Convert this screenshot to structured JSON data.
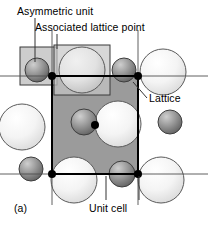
{
  "figure": {
    "panel_label": "(a)",
    "labels": {
      "asymmetric_unit": "Asymmetric unit",
      "associated_lattice_point": "Associated lattice point",
      "lattice": "Lattice",
      "unit_cell": "Unit cell"
    },
    "colors": {
      "background": "#ffffff",
      "line": "#000000",
      "unit_cell_fill": "#9a9a9a",
      "highlight_box_fill": "#c9c9c9",
      "large_atom_light": "#f2f2f2",
      "large_atom_edge": "#555555",
      "small_atom_dark": "#6e6e6e",
      "small_atom_edge": "#3a3a3a",
      "lattice_point": "#000000"
    },
    "geometry": {
      "unit_cell": {
        "x": 52,
        "y": 76,
        "width": 86,
        "height": 98
      },
      "asymmetric_unit_box": {
        "x": 20,
        "y": 47,
        "width": 37,
        "height": 38
      },
      "associated_lattice_point_box": {
        "x": 54,
        "y": 45,
        "width": 56,
        "height": 50
      },
      "lattice_rows_y": [
        76,
        174
      ],
      "lattice_cols_x": [
        52,
        138
      ],
      "large_atom_radius": 22,
      "small_atom_radius": 11
    },
    "lattice_points": [
      {
        "x": 52,
        "y": 76
      },
      {
        "x": 138,
        "y": 76
      },
      {
        "x": 52,
        "y": 174
      },
      {
        "x": 138,
        "y": 174
      },
      {
        "x": 95,
        "y": 125
      }
    ],
    "large_atoms": [
      {
        "x": 82,
        "y": 70,
        "r": 23
      },
      {
        "x": 163,
        "y": 72,
        "r": 23
      },
      {
        "x": 22,
        "y": 127,
        "r": 23
      },
      {
        "x": 118,
        "y": 124,
        "r": 23
      },
      {
        "x": 74,
        "y": 180,
        "r": 23
      },
      {
        "x": 161,
        "y": 180,
        "r": 23
      }
    ],
    "small_atoms": [
      {
        "x": 37,
        "y": 70,
        "r": 12
      },
      {
        "x": 124,
        "y": 70,
        "r": 12
      },
      {
        "x": 84,
        "y": 122,
        "r": 13
      },
      {
        "x": 170,
        "y": 122,
        "r": 12
      },
      {
        "x": 31,
        "y": 169,
        "r": 12
      },
      {
        "x": 122,
        "y": 174,
        "r": 13
      }
    ],
    "leader_lines": [
      {
        "name": "asymmetric-unit-leader",
        "x1": 35,
        "y1": 18,
        "x2": 35,
        "y2": 62
      },
      {
        "name": "associated-lattice-point-leader",
        "x1": 57,
        "y1": 34,
        "x2": 57,
        "y2": 49
      },
      {
        "name": "lattice-leader",
        "x1": 147,
        "y1": 98,
        "x2": 133,
        "y2": 82
      },
      {
        "name": "unit-cell-leader-left",
        "x1": 106,
        "y1": 200,
        "x2": 106,
        "y2": 176
      },
      {
        "name": "unit-cell-leader-right",
        "x1": 139,
        "y1": 200,
        "x2": 139,
        "y2": 176
      }
    ]
  }
}
